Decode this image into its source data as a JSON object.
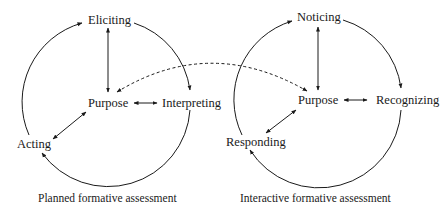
{
  "diagram": {
    "left": {
      "caption": "Planned formative assessment",
      "nodes": {
        "top": "Eliciting",
        "center": "Purpose",
        "right": "Interpreting",
        "left": "Acting"
      }
    },
    "right": {
      "caption": "Interactive formative assessment",
      "nodes": {
        "top": "Noticing",
        "center": "Purpose",
        "right": "Recognizing",
        "left": "Responding"
      }
    },
    "link": "dashed bidirectional arrow between the two Purpose nodes",
    "colors": {
      "line": "#1a1a1a",
      "background": "#ffffff"
    }
  }
}
